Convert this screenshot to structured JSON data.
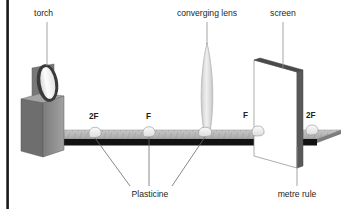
{
  "diagram": {
    "background_color": "#ffffff",
    "labels": {
      "torch": "torch",
      "converging_lens": "converging lens",
      "screen": "screen",
      "plasticine": "Plasticine",
      "metre_rule": "metre rule"
    },
    "marks": {
      "left_2f": "2F",
      "left_f": "F",
      "right_f": "F",
      "right_2f": "2F"
    },
    "colors": {
      "ink": "#231f20",
      "leader": "#8d8d8d",
      "wall_bar": "#1a1a1a",
      "rule_top": "#b3b3b3",
      "rule_edge": "#111111",
      "rule_side": "#9a9a9a",
      "torch_body_front": "#8c8c8c",
      "torch_body_side": "#6e6e6e",
      "torch_ring": "#3a3a3a",
      "torch_face": "#ffffff",
      "lens_fill": "#e3e3e3",
      "lens_stroke": "#b8b8b8",
      "screen_face": "#ffffff",
      "screen_edge": "#595959",
      "screen_top": "#4a4a4a",
      "plasticine_fill": "#f2f2f2",
      "plasticine_stroke": "#9c9c9c"
    },
    "elements": [
      {
        "name": "wall-bar",
        "kind": "vertical-bar"
      },
      {
        "name": "torch",
        "kind": "box-with-lens"
      },
      {
        "name": "metre-rule",
        "kind": "ruler"
      },
      {
        "name": "plasticine-blob",
        "kind": "blob",
        "count": 4
      },
      {
        "name": "converging-lens",
        "kind": "biconvex-lens"
      },
      {
        "name": "screen",
        "kind": "flat-panel"
      }
    ]
  }
}
